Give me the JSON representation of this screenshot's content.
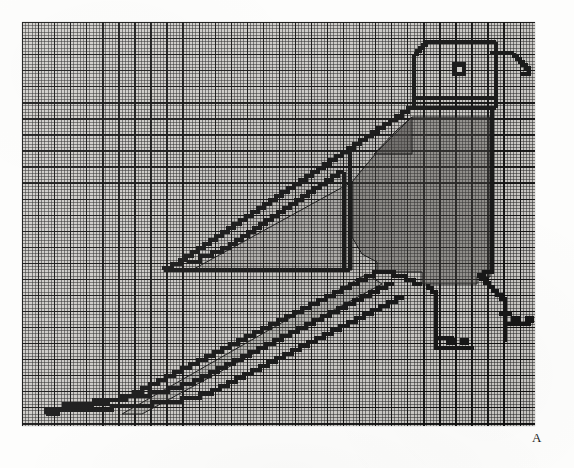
{
  "figure": {
    "label": "A",
    "caption_letter": "A",
    "medium": "pencil on millimetre graph paper, scanned"
  },
  "sheet": {
    "paper_color": "#cfcdc9",
    "minor_grid_color": "#282828",
    "major_grid_color": "#0a0a0a",
    "minor_cell_px": 3.21,
    "major_every_n_cells": 5,
    "width_px": 513,
    "height_px": 404,
    "columns": 160,
    "rows": 126
  },
  "drawing": {
    "line_color": "#141414",
    "fill_color": "#55514e",
    "fill_opacity": 0.55,
    "unit_px": 3.21,
    "parts": [
      {
        "name": "head",
        "note": "rounded rectangle, top-right"
      },
      {
        "name": "eye",
        "note": "small filled square with white centre"
      },
      {
        "name": "beak",
        "note": "stepped diagonal to the right"
      },
      {
        "name": "neck-band",
        "note": "double horizontal line under head"
      },
      {
        "name": "body",
        "note": "shaded torso"
      },
      {
        "name": "wing",
        "note": "triangular outline with inner diagonal"
      },
      {
        "name": "tail",
        "note": "three long parallel stepped diagonals to lower left"
      },
      {
        "name": "legs",
        "note": "two stepped legs with feet"
      }
    ]
  },
  "bird_path": {
    "outline": "M 130.0 79.0 L 130.0 15.5 L 133.2 15.5 L 133.2 12.3 L 136.4 12.3 L 136.4 9.1 L 139.6 9.1 L 139.6 5.9 L 158.0 5.9 L 158.0 9.1 L 161.2 9.1 L 161.2 22.0 L 164.4 22.0 L 164.4 25.2 L 167.6 25.2 L 167.6 28.4 L 170.8 28.4 L 170.8 31.6 L 174.0 31.6 L 174.0 34.8 L 177.2 34.8",
    "_comment": "path data are approximate cell coordinates; drawing rendered with explicit SVG below"
  }
}
